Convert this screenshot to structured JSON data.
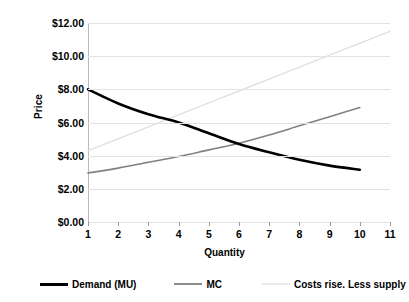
{
  "chart_data": {
    "type": "line",
    "title": "",
    "xlabel": "Quantity",
    "ylabel": "Price",
    "x": [
      1,
      2,
      3,
      4,
      5,
      6,
      7,
      8,
      9,
      10,
      11
    ],
    "categories": [
      "1",
      "2",
      "3",
      "4",
      "5",
      "6",
      "7",
      "8",
      "9",
      "10",
      "11"
    ],
    "xtick_labels": [
      "1",
      "2",
      "3",
      "4",
      "5",
      "6",
      "7",
      "8",
      "9",
      "10",
      "11"
    ],
    "ytick_labels": [
      "$0.00",
      "$2.00",
      "$4.00",
      "$6.00",
      "$8.00",
      "$10.00",
      "$12.00"
    ],
    "ytick_values": [
      0,
      2,
      4,
      6,
      8,
      10,
      12
    ],
    "ylim": [
      0,
      12
    ],
    "xlim": [
      1,
      11
    ],
    "grid": "horizontal",
    "legend_position": "bottom",
    "series": [
      {
        "name": "Demand (MU)",
        "color": "#000000",
        "width": 2.6,
        "x": [
          1,
          2,
          3,
          4,
          5,
          6,
          7,
          8,
          9,
          10
        ],
        "values": [
          8.0,
          7.15,
          6.5,
          6.0,
          5.35,
          4.7,
          4.2,
          3.75,
          3.4,
          3.15
        ]
      },
      {
        "name": "MC",
        "color": "#808080",
        "width": 1.6,
        "x": [
          1,
          2,
          3,
          4,
          5,
          6,
          7,
          8,
          9,
          10
        ],
        "values": [
          2.95,
          3.25,
          3.6,
          3.95,
          4.35,
          4.75,
          5.25,
          5.8,
          6.35,
          6.9
        ]
      },
      {
        "name": "Costs rise. Less supply",
        "color": "#e0e0e0",
        "width": 1.4,
        "x": [
          1,
          2,
          3,
          4,
          5,
          6,
          7,
          8,
          9,
          10,
          11
        ],
        "values": [
          4.3,
          5.02,
          5.74,
          6.46,
          7.18,
          7.9,
          8.62,
          9.34,
          10.06,
          10.78,
          11.5
        ]
      }
    ]
  },
  "axes": {
    "y_title": "Price",
    "x_title": "Quantity"
  },
  "legend": {
    "items": [
      {
        "label": "Demand (MU)",
        "color": "#000000",
        "width": 3
      },
      {
        "label": "MC",
        "color": "#8c8c8c",
        "width": 2
      },
      {
        "label": "Costs rise. Less supply",
        "color": "#e8e8e8",
        "width": 2
      }
    ]
  },
  "colors": {
    "background": "#ffffff",
    "grid": "#e2e2e2",
    "axis": "#9a9a9a",
    "text": "#000000"
  }
}
